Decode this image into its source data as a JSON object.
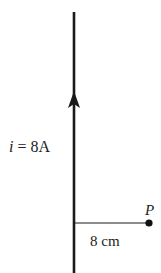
{
  "diagram": {
    "type": "physics-magnetic-field-straight-wire",
    "wire": {
      "direction": "up",
      "current_label_var": "i",
      "current_label_eq": " = 8A",
      "current_value": 8,
      "current_unit": "A"
    },
    "point": {
      "label": "P",
      "distance_label": "8 cm",
      "distance_value": 8,
      "distance_unit": "cm"
    },
    "colors": {
      "line": "#1a1a1a",
      "text": "#222222",
      "background": "#ffffff"
    }
  }
}
